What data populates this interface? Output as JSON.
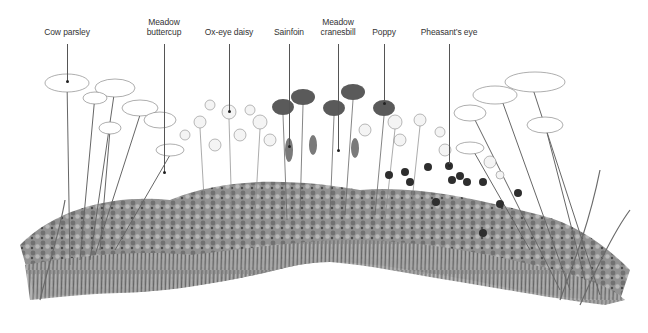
{
  "diagram": {
    "type": "labeled-illustration",
    "colors": {
      "background": "#ffffff",
      "label_text": "#333333",
      "leader_line": "#555555",
      "poppy": "#5a5a5a",
      "pheasants_eye": "#2e2e2e",
      "foliage_dark": "#4a4a4a",
      "foliage_mid": "#8a8a8a",
      "foliage_light": "#bdbdbd"
    },
    "labels": [
      {
        "id": "cow-parsley",
        "text": "Cow parsley",
        "x": 67,
        "y": 27,
        "line_top": 44,
        "line_bottom": 81
      },
      {
        "id": "meadow-buttercup",
        "text": "Meadow\nbuttercup",
        "x": 164,
        "y": 17,
        "line_top": 44,
        "line_bottom": 172
      },
      {
        "id": "ox-eye-daisy",
        "text": "Ox-eye daisy",
        "x": 229,
        "y": 27,
        "line_top": 44,
        "line_bottom": 111
      },
      {
        "id": "sainfoin",
        "text": "Sainfoin",
        "x": 289,
        "y": 27,
        "line_top": 44,
        "line_bottom": 146
      },
      {
        "id": "meadow-cranesbill",
        "text": "Meadow\ncranesbill",
        "x": 338,
        "y": 17,
        "line_top": 44,
        "line_bottom": 150
      },
      {
        "id": "poppy",
        "text": "Poppy",
        "x": 384,
        "y": 27,
        "line_top": 44,
        "line_bottom": 103
      },
      {
        "id": "pheasants-eye",
        "text": "Pheasant’s eye",
        "x": 449,
        "y": 27,
        "line_top": 44,
        "line_bottom": 165
      }
    ]
  }
}
